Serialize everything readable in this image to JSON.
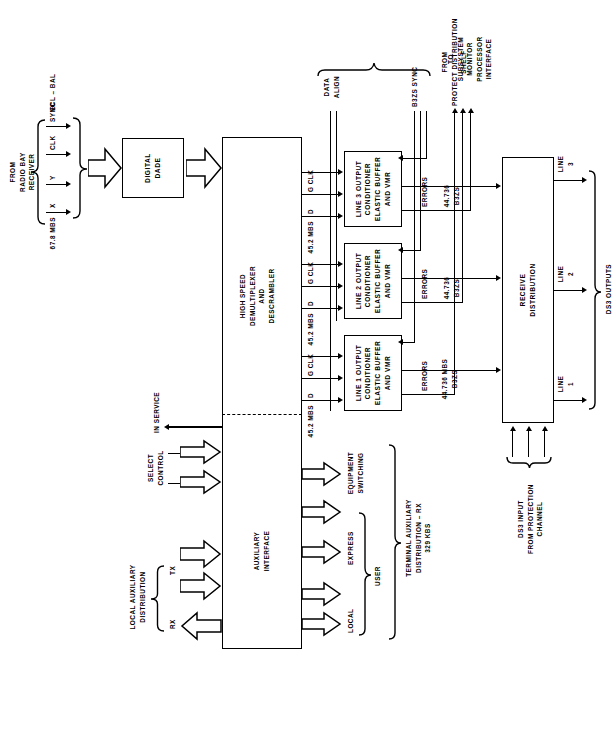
{
  "diagram": {
    "orientation": "rotated-90-ccw"
  },
  "blocks": [
    {
      "id": "aux_interface",
      "label": "AUXILIARY\nINTERFACE"
    },
    {
      "id": "hs_demux",
      "label": "HIGH SPEED\nDEMULTIPLEXER\nAND\nDESCRAMBLER"
    },
    {
      "id": "digital_dade",
      "label": "DIGITAL\nDADE"
    },
    {
      "id": "line1_cond",
      "label": "LINE 1 OUTPUT\nCONDITIONER\nELASTIC BUFFER\nAND VMR"
    },
    {
      "id": "line2_cond",
      "label": "LINE 2 OUTPUT\nCONDITIONER\nELASTIC BUFFER\nAND VMR"
    },
    {
      "id": "line3_cond",
      "label": "LINE 3 OUTPUT\nCONDITIONER\nELASTIC BUFFER\nAND VMR"
    },
    {
      "id": "receive_dist",
      "label": "RECEIVE\nDISTRIBUTION"
    }
  ],
  "labels": {
    "from_radio_bay": "FROM\nRADIO BAY\nRECEIVER",
    "rate_678": "67.8 MBS",
    "sig_x": "X",
    "sig_y": "Y",
    "sig_clk": "CLK",
    "sig_sync": "SYNC",
    "ecl_bal": "ECL – BAL",
    "rx": "RX",
    "tx": "TX",
    "local_aux_dist": "LOCAL AUXILIARY\nDISTRIBUTION",
    "select_control": "SELECT\nCONTROL",
    "in_service": "IN SERVICE",
    "local": "LOCAL",
    "express": "EXPRESS",
    "user": "USER",
    "equipment_switching": "EQUIPMENT\nSWITCHING",
    "terminal_aux_dist": "TERMINAL AUXILIARY\nDISTRIBUTION – RX\n329 KBS",
    "rate_452": "45.2 MBS",
    "sig_d": "D",
    "sig_gclk": "G CLK",
    "data_align": "DATA\nALIGN",
    "from_protect_shelf": "FROM\nPROTECT DISTRIBUTION\nSHELF",
    "b3zs_sync": "B3ZS SYNC",
    "errors": "ERRORS",
    "to_subsystem": "TO\nSUBSYSTEM\nMONITOR\nPROCESSOR\nINTERFACE",
    "rate_44736_full": "44.736 MBS\nB3ZS",
    "rate_44736": "44.736\nB3ZS",
    "ds3_input": "DS3 INPUT\nFROM PROTECTION\nCHANNEL",
    "line1": "LINE\n1",
    "line2": "LINE\n2",
    "line3": "LINE\n3",
    "ds3_outputs": "DS3 OUTPUTS"
  },
  "colors": {
    "ink": "#000000",
    "paper": "#ffffff"
  }
}
